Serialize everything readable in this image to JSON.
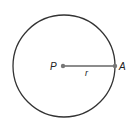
{
  "diagram": {
    "type": "circle-radius",
    "center_label": "P",
    "point_label": "A",
    "radius_label": "r",
    "colors": {
      "stroke": "#333333",
      "radius_line": "#666666",
      "point": "#777777",
      "text": "#222222"
    }
  }
}
